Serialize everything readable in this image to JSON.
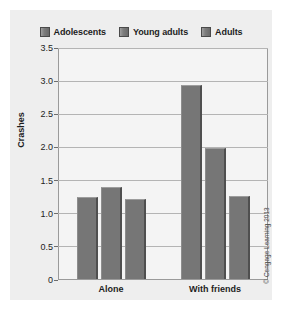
{
  "figure": {
    "credit": "© Cengage Learning 2013",
    "background_color": "#eeeeee",
    "bar_color": "#767676",
    "plot_background_color": "#f4f4f4",
    "gridline_color": "#b4b4b4"
  },
  "chart_data": {
    "type": "bar",
    "title": "",
    "xlabel": "",
    "ylabel": "Crashes",
    "ylim": [
      0,
      3.5
    ],
    "yticks": [
      "0",
      "0.5",
      "1.0",
      "1.5",
      "2.0",
      "2.5",
      "3.0",
      "3.5"
    ],
    "ytick_values": [
      0,
      0.5,
      1.0,
      1.5,
      2.0,
      2.5,
      3.0,
      3.5
    ],
    "grid": true,
    "legend_position": "top-center",
    "categories": [
      "Alone",
      "With friends"
    ],
    "series": [
      {
        "name": "Adolescents",
        "color": "#767676",
        "values": [
          1.25,
          2.95
        ]
      },
      {
        "name": "Young adults",
        "color": "#767676",
        "values": [
          1.4,
          2.0
        ]
      },
      {
        "name": "Adults",
        "color": "#767676",
        "values": [
          1.22,
          1.27
        ]
      }
    ]
  }
}
